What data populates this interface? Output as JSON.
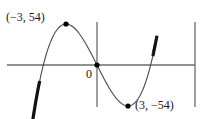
{
  "chart_data": {
    "type": "line",
    "title": "",
    "function": "x^3 - 27x",
    "xlim": [
      -9.0,
      9.6
    ],
    "ylim": [
      -55.5,
      56.5
    ],
    "grid": false,
    "series": [
      {
        "name": "f(x)",
        "color": "#555555",
        "x_range": [
          -5.95,
          5.6
        ]
      }
    ],
    "emphasized_segments": [
      {
        "x_range": [
          -6.25,
          -5.55
        ],
        "color": "#111111"
      },
      {
        "x_range": [
          5.4,
          5.8
        ],
        "color": "#111111"
      }
    ],
    "points": [
      {
        "x": -3,
        "y": 54,
        "label": "(−3, 54)"
      },
      {
        "x": 0,
        "y": 0,
        "label": "0"
      },
      {
        "x": 3,
        "y": -54,
        "label": "(3, −54)"
      }
    ]
  },
  "labels": {
    "max_point": "(−3, 54)",
    "origin": "0",
    "min_point": "(3, −54)"
  }
}
